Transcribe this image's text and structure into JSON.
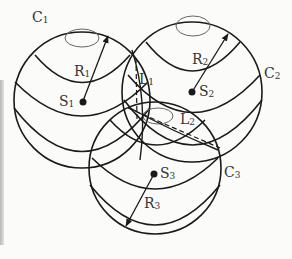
{
  "diagram": {
    "type": "three-intersecting-spheres",
    "colors": {
      "line": "#1a1a1a",
      "text": "#333333",
      "background": "#fbfbfa"
    },
    "spheres": [
      {
        "id": "sphere-1",
        "contour_label": "C",
        "contour_sub": "1",
        "center_label": "S",
        "center_sub": "1",
        "radius_label": "R",
        "radius_sub": "1"
      },
      {
        "id": "sphere-2",
        "contour_label": "C",
        "contour_sub": "2",
        "center_label": "S",
        "center_sub": "2",
        "radius_label": "R",
        "radius_sub": "2"
      },
      {
        "id": "sphere-3",
        "contour_label": "C",
        "contour_sub": "3",
        "center_label": "S",
        "center_sub": "3",
        "radius_label": "R",
        "radius_sub": "3"
      }
    ],
    "intersection_lines": [
      {
        "id": "L1",
        "label": "L",
        "sub": "1",
        "style": "dashed"
      },
      {
        "id": "L2",
        "label": "L",
        "sub": "2",
        "style": "dashed"
      }
    ]
  }
}
